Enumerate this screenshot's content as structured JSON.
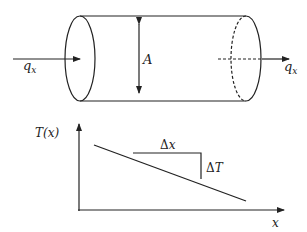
{
  "figure": {
    "cylinder": {
      "area_label": "A",
      "flux_in_label": "q",
      "flux_in_subscript": "x",
      "flux_out_label": "q",
      "flux_out_subscript": "x"
    },
    "graph": {
      "y_axis_label": "T(x)",
      "x_axis_label": "x",
      "delta_x_symbol": "Δ",
      "delta_x_var": "x",
      "delta_t_symbol": "Δ",
      "delta_t_var": "T"
    },
    "colors": {
      "stroke": "#222222",
      "background": "#ffffff"
    }
  }
}
